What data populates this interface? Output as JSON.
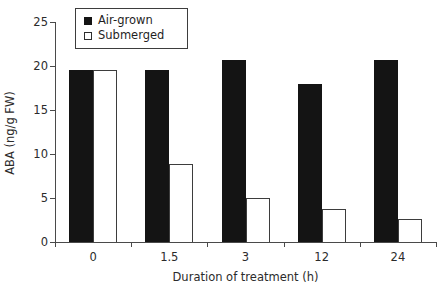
{
  "chart_data": {
    "type": "bar",
    "title": "",
    "subtitle": "",
    "xlabel": "Duration of treatment (h)",
    "ylabel": "ABA (ng/g FW)",
    "categories": [
      "0",
      "1.5",
      "3",
      "12",
      "24"
    ],
    "series": [
      {
        "name": "Air-grown",
        "values": [
          19.5,
          19.6,
          20.7,
          18.0,
          20.7
        ],
        "color": "#141414",
        "fill": "solid"
      },
      {
        "name": "Submerged",
        "values": [
          19.5,
          8.9,
          5.0,
          3.8,
          2.6
        ],
        "color": "#ffffff",
        "fill": "open"
      }
    ],
    "ylim": [
      0,
      25
    ],
    "yticks": [
      0,
      5,
      10,
      15,
      20,
      25
    ],
    "ytick_labels": [
      "0",
      "5",
      "10",
      "15",
      "20",
      "25"
    ],
    "grid": false,
    "legend_position": "top-left-inside",
    "legend_entries": [
      "Air-grown",
      "Submerged"
    ]
  },
  "legend": {
    "items": [
      {
        "label": "Air-grown",
        "marker": "filled-square-marker"
      },
      {
        "label": "Submerged",
        "marker": "open-square-marker"
      }
    ]
  }
}
